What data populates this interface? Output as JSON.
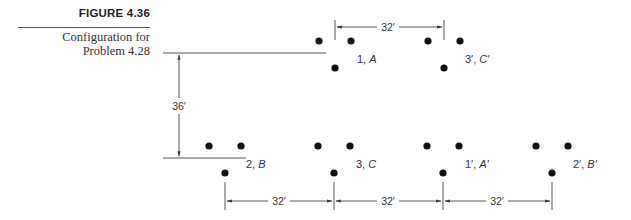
{
  "figure": {
    "number": "FIGURE 4.36",
    "caption_line1": "Configuration for",
    "caption_line2": "Problem 4.28"
  },
  "diagram": {
    "top_row": [
      {
        "label_num": "1, ",
        "label_phase": "A"
      },
      {
        "label_num": "3′, ",
        "label_phase": "C′"
      }
    ],
    "bottom_row": [
      {
        "label_num": "2, ",
        "label_phase": "B"
      },
      {
        "label_num": "3, ",
        "label_phase": "C"
      },
      {
        "label_num": "1′, ",
        "label_phase": "A′"
      },
      {
        "label_num": "2′, ",
        "label_phase": "B′"
      }
    ],
    "dimensions": {
      "top_spacing": "32′",
      "vertical_spacing": "36′",
      "bottom_spacing_1": "32′",
      "bottom_spacing_2": "32′",
      "bottom_spacing_3": "32′"
    },
    "colors": {
      "ink": "#111111",
      "line": "#444444",
      "text": "#333333"
    }
  }
}
